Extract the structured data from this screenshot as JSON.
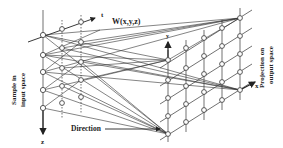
{
  "diagram": {
    "type": "mapping-diagram",
    "labels": {
      "input_space": [
        "Sample in",
        "input space"
      ],
      "output_space": [
        "Projection on",
        "output space"
      ],
      "weight": "W(x,y,z)",
      "direction": "Direction",
      "axis_t": "t",
      "axis_z": "z",
      "axis_y": "y",
      "axis_x": "x"
    },
    "colors": {
      "line": "#2a2a2a",
      "node_fill": "#ffffff",
      "text": "#222222"
    },
    "left_grid": {
      "columns": 3,
      "rows": 5
    },
    "right_grid": {
      "columns": 5,
      "rows": 5
    }
  }
}
